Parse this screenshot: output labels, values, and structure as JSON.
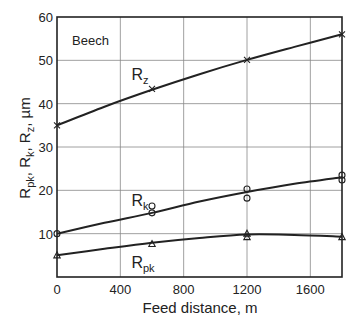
{
  "chart_data": {
    "type": "line",
    "title": "",
    "annotation": "Beech",
    "xlabel": "Feed distance, m",
    "ylabel": "R_pk, R_k, R_z, µm",
    "ylabel_parts": [
      "R",
      "pk",
      ", R",
      "k",
      ", R",
      "z",
      ", µm"
    ],
    "xlim": [
      0,
      1800
    ],
    "ylim": [
      0,
      60
    ],
    "xticks": [
      0,
      400,
      800,
      1200,
      1600
    ],
    "yticks": [
      10,
      20,
      30,
      40,
      50,
      60
    ],
    "grid": true,
    "legend": "inline labels",
    "series": [
      {
        "name": "Rz",
        "label_main": "R",
        "label_sub": "z",
        "marker": "x",
        "points": [
          {
            "x": 0,
            "y": 35.0
          },
          {
            "x": 600,
            "y": 43.4
          },
          {
            "x": 1200,
            "y": 50.1
          },
          {
            "x": 1800,
            "y": 56.0
          }
        ],
        "fit": [
          [
            0,
            35.0
          ],
          [
            300,
            39.3
          ],
          [
            600,
            43.2
          ],
          [
            900,
            46.8
          ],
          [
            1200,
            50.1
          ],
          [
            1500,
            53.1
          ],
          [
            1800,
            56.0
          ]
        ],
        "label_pos": {
          "x": 470,
          "y": 45.5
        }
      },
      {
        "name": "Rk",
        "label_main": "R",
        "label_sub": "k",
        "marker": "o",
        "points": [
          {
            "x": 0,
            "y": 10.0
          },
          {
            "x": 600,
            "y": 16.4
          },
          {
            "x": 600,
            "y": 14.8
          },
          {
            "x": 1200,
            "y": 20.3
          },
          {
            "x": 1200,
            "y": 18.2
          },
          {
            "x": 1800,
            "y": 23.5
          },
          {
            "x": 1800,
            "y": 22.4
          }
        ],
        "fit": [
          [
            0,
            10.0
          ],
          [
            300,
            12.5
          ],
          [
            600,
            14.8
          ],
          [
            900,
            17.4
          ],
          [
            1200,
            19.6
          ],
          [
            1500,
            21.5
          ],
          [
            1800,
            23.0
          ]
        ],
        "label_pos": {
          "x": 470,
          "y": 16.5
        }
      },
      {
        "name": "Rpk",
        "label_main": "R",
        "label_sub": "pk",
        "marker": "triangle",
        "points": [
          {
            "x": 0,
            "y": 5.0
          },
          {
            "x": 600,
            "y": 7.6
          },
          {
            "x": 1200,
            "y": 10.0
          },
          {
            "x": 1200,
            "y": 9.2
          },
          {
            "x": 1800,
            "y": 9.2
          }
        ],
        "fit": [
          [
            0,
            5.0
          ],
          [
            300,
            6.5
          ],
          [
            600,
            7.9
          ],
          [
            900,
            9.0
          ],
          [
            1200,
            9.8
          ],
          [
            1500,
            9.7
          ],
          [
            1800,
            9.3
          ]
        ],
        "label_pos": {
          "x": 470,
          "y": 2.0
        }
      }
    ]
  }
}
